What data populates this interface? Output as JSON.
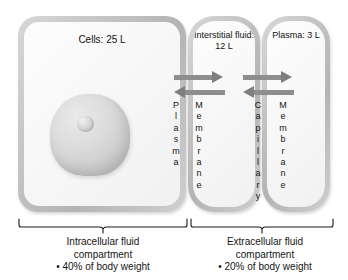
{
  "figure": {
    "watermark_text": "muscleaddic",
    "compartments": [
      {
        "id": "cells",
        "title": "Cells: 25 L",
        "nucleus_name": "cell-nucleus",
        "nucleolus_name": "cell-nucleolus"
      },
      {
        "id": "interstitial",
        "title_line1": "Interstitial",
        "title_line2": "fluid: 12 L"
      },
      {
        "id": "plasma",
        "title_line1": "Plasma:",
        "title_line2": "3 L"
      }
    ],
    "vertical_labels": [
      {
        "id": "plasma-membrane-left",
        "text": "Plasma"
      },
      {
        "id": "membrane-middle",
        "text": "Membrane"
      },
      {
        "id": "capillary",
        "text": "Capillary"
      },
      {
        "id": "membrane-right",
        "text": "Membrane"
      }
    ],
    "arrows": [
      {
        "id": "exchange-cells-interstitial",
        "direction": "bidirectional",
        "color": "#8e8e8e"
      },
      {
        "id": "exchange-interstitial-plasma",
        "direction": "bidirectional",
        "color": "#8e8e8e"
      }
    ],
    "brackets": [
      {
        "id": "intracellular",
        "lines": [
          "Intracellular fluid",
          "compartment",
          "• 40% of body weight"
        ]
      },
      {
        "id": "extracellular",
        "lines": [
          "Extracellular fluid",
          "compartment",
          "• 20% of body weight"
        ]
      }
    ],
    "colors": {
      "box_border": "#bdbdbd",
      "box_fill": "#f7f7f7",
      "arrow": "#8e8e8e",
      "text": "#151515"
    }
  }
}
